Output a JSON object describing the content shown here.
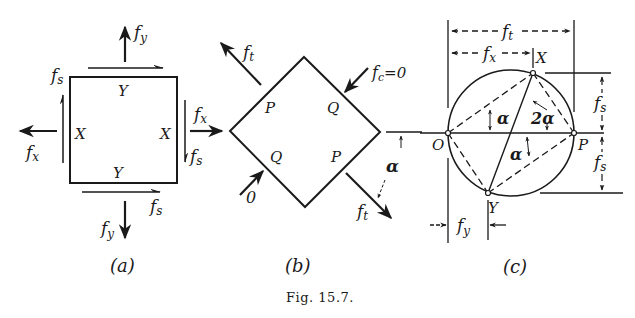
{
  "figure": {
    "caption": "Fig. 15.7.",
    "panels": [
      {
        "id": "a",
        "label": "(a)",
        "labels": {
          "fy_top": "f",
          "fy_top_sub": "y",
          "fs_top": "f",
          "fs_top_sub": "s",
          "fx_left": "f",
          "fx_left_sub": "x",
          "fx_right": "f",
          "fx_right_sub": "x",
          "fs_right": "f",
          "fs_right_sub": "s",
          "fs_bottom": "f",
          "fs_bottom_sub": "s",
          "fy_bottom": "f",
          "fy_bottom_sub": "y",
          "y_top": "Y",
          "y_bottom": "Y",
          "x_left": "X",
          "x_right": "X"
        }
      },
      {
        "id": "b",
        "label": "(b)",
        "labels": {
          "ft_top": "f",
          "ft_top_sub": "t",
          "fc": "f",
          "fc_sub": "c",
          "fc_eq": "=0",
          "p_top": "P",
          "q_top": "Q",
          "q_bottom": "Q",
          "p_bottom": "P",
          "zero": "0",
          "alpha": "α",
          "ft_bottom": "f",
          "ft_bottom_sub": "t"
        }
      },
      {
        "id": "c",
        "label": "(c)",
        "labels": {
          "ft": "f",
          "ft_sub": "t",
          "fx": "f",
          "fx_sub": "x",
          "x_point": "X",
          "y_point": "Y",
          "o_point": "O",
          "p_point": "P",
          "alpha_upper": "α",
          "two_alpha": "2α",
          "alpha_lower": "α",
          "fs_upper": "f",
          "fs_upper_sub": "s",
          "fs_lower": "f",
          "fs_lower_sub": "s",
          "fy": "f",
          "fy_sub": "y"
        }
      }
    ]
  }
}
